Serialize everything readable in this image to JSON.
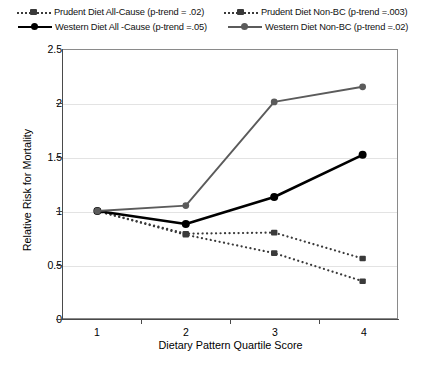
{
  "chart_data": {
    "type": "line",
    "title": "",
    "xlabel": "Dietary Pattern Quartile Score",
    "ylabel": "Relative Risk for Mortality",
    "categories": [
      "1",
      "2",
      "3",
      "4"
    ],
    "x": [
      1,
      2,
      3,
      4
    ],
    "xlim": [
      0.6,
      4.4
    ],
    "ylim": [
      0,
      2.5
    ],
    "yticks": [
      "0",
      "0.5",
      "1",
      "1.5",
      "2",
      "2.5"
    ],
    "ytick_values": [
      0,
      0.5,
      1,
      1.5,
      2,
      2.5
    ],
    "grid": "horizontal",
    "legend_position": "top",
    "series": [
      {
        "name": "Prudent Diet All-Cause (p-trend = .02)",
        "short_name": "Prudent Diet All-Cause",
        "p_trend": ".02",
        "values": [
          1.0,
          0.79,
          0.8,
          0.56
        ],
        "style": "dotted",
        "marker": "square",
        "color": "#3a3a3a"
      },
      {
        "name": "Prudent Diet Non-BC (p-trend =.003)",
        "short_name": "Prudent Diet Non-BC",
        "p_trend": ".003",
        "values": [
          1.0,
          0.78,
          0.61,
          0.35
        ],
        "style": "dotted",
        "marker": "square",
        "color": "#3a3a3a"
      },
      {
        "name": "Western Diet All -Cause (p-trend =.05)",
        "short_name": "Western Diet All -Cause",
        "p_trend": ".05",
        "values": [
          1.0,
          0.88,
          1.13,
          1.52
        ],
        "style": "solid",
        "marker": "circle",
        "color": "#000000"
      },
      {
        "name": "Western Diet Non-BC (p-trend =.02)",
        "short_name": "Western Diet Non-BC",
        "p_trend": ".02",
        "values": [
          1.0,
          1.05,
          2.01,
          2.15
        ],
        "style": "solid",
        "marker": "circle",
        "color": "#5b5b5b"
      }
    ]
  },
  "legend": {
    "items": [
      {
        "label": "Prudent Diet All-Cause (p-trend = .02)"
      },
      {
        "label": "Prudent Diet Non-BC (p-trend =.003)"
      },
      {
        "label": "Western Diet All -Cause (p-trend =.05)"
      },
      {
        "label": "Western Diet Non-BC (p-trend =.02)"
      }
    ]
  },
  "axes": {
    "y_title": "Relative Risk for Mortality",
    "x_title": "Dietary Pattern Quartile Score",
    "y_ticks": [
      "2.5",
      "2",
      "1.5",
      "1",
      "0.5",
      "0"
    ],
    "x_ticks": [
      "1",
      "2",
      "3",
      "4"
    ]
  }
}
